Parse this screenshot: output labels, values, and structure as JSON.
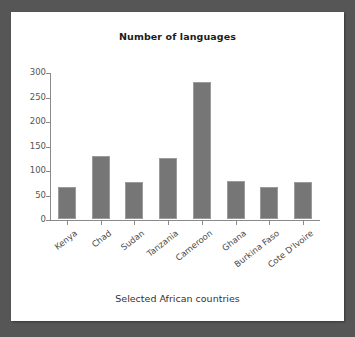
{
  "chart_data": {
    "type": "bar",
    "title": "Number of languages",
    "xlabel": "Selected African countries",
    "ylabel": "",
    "categories": [
      "Kenya",
      "Chad",
      "Sudan",
      "Tanzania",
      "Cameroon",
      "Ghana",
      "Burkina Faso",
      "Cote D'Ivoire"
    ],
    "values": [
      66,
      128,
      76,
      124,
      279,
      77,
      66,
      76
    ],
    "ylim": [
      0,
      300
    ],
    "yticks": [
      0,
      50,
      100,
      150,
      200,
      250,
      300
    ],
    "ytick_labels": [
      "0",
      "50",
      "100",
      "150",
      "200",
      "250",
      "300"
    ],
    "grid": false,
    "legend": false,
    "legend_position": "none",
    "bar_color": "#767676",
    "bar_edge_color": "#9b9b9b",
    "axis_color": "#8a8a8a",
    "panel_background": "#ffffff",
    "page_background": "#565656",
    "title_color": "#1c1c1c",
    "tick_label_color": "#555555"
  }
}
